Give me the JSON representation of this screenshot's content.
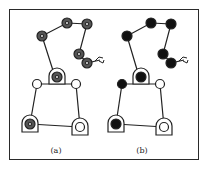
{
  "figure": {
    "panels": [
      {
        "id": "a",
        "label": "(a)",
        "joint_style": "ringed"
      },
      {
        "id": "b",
        "label": "(b)",
        "joint_style": "filled"
      }
    ],
    "colors": {
      "ink": "#222222",
      "background": "#ffffff",
      "joint_fill_b": "#111111",
      "joint_fill_a": "#444444"
    }
  }
}
